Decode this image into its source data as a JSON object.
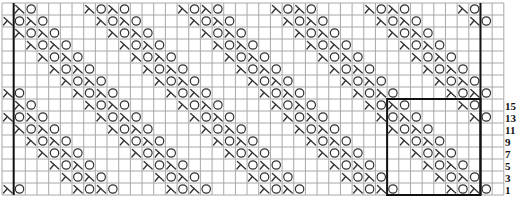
{
  "chart_data": {
    "type": "knitting-chart",
    "columns": 43,
    "rows": 16,
    "cell_width": 11.67,
    "cell_height": 12,
    "origin": {
      "x": 2,
      "y": 3
    },
    "legend_symbols": {
      "X": "decrease (lambda / k2tog-style symbol)",
      "O": "yarn over",
      ".": "blank / knit"
    },
    "grid_rows": [
      ".XO....XOXO....XOXO....XOXO....XOXO....XO..",
      "XOXO....XOXO....XOXO....XOXO....XOXO....XO.",
      ".XOXO....XOXO....XOXO....XOXO....XOXO......",
      "..XOXO....XOXO....XOXO....XOXO....XOXO.....",
      "...XOXO....XOXO....XOXO....XOXO....XOXO....",
      "....XOXO....XOXO....XOXO....XOXO....XOXO...",
      ".....XOXO....XOXO....XOXO....XOXO....XOXO..",
      "XO....XOXO....XOXO....XOXO....XOXO....XOXO.",
      ".XO....XOXO....XOXO....XOXO....XOXO....XO..",
      "XOXO....XOXO....XOXO....XOXO....XOXO....XO.",
      ".XOXO....XOXO....XOXO....XOXO....XOXO......",
      "..XOXO....XOXO....XOXO....XOXO....XOXO.....",
      "...XOXO....XOXO....XOXO....XOXO....XOXO....",
      "....XOXO....XOXO....XOXO....XOXO....XOXO...",
      ".....XOXO....XOXO....XOXO....XOXO....XOXO..",
      "XO....XOXO....XOXO....XOXO....XOXO....XOXO."
    ],
    "row_labels": [
      {
        "row": 8,
        "text": "15"
      },
      {
        "row": 9,
        "text": "13"
      },
      {
        "row": 10,
        "text": "11"
      },
      {
        "row": 11,
        "text": "9"
      },
      {
        "row": 12,
        "text": "7"
      },
      {
        "row": 13,
        "text": "5"
      },
      {
        "row": 14,
        "text": "3"
      },
      {
        "row": 15,
        "text": "1"
      }
    ],
    "edge_lines": {
      "left_after_column": 1,
      "right_after_column": 41
    },
    "repeat_box": {
      "col_start": 33,
      "col_end": 41,
      "row_start": 8,
      "row_end": 16
    },
    "colors": {
      "grid": "#a8a8a8",
      "thick_lines": "#111111",
      "symbols": "#333333",
      "labels": "#111111"
    }
  }
}
